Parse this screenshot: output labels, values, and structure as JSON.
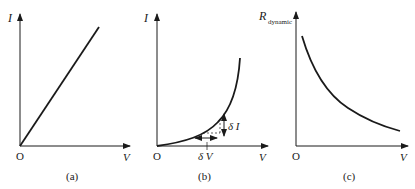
{
  "figure": {
    "panels": [
      {
        "id": "a",
        "caption": "(a)",
        "y_axis_label": "I",
        "x_axis_label": "V",
        "origin_label": "O",
        "curve": "linear"
      },
      {
        "id": "b",
        "caption": "(b)",
        "y_axis_label": "I",
        "x_axis_label": "V",
        "origin_label": "O",
        "curve": "exponential-rise",
        "annotations": {
          "delta_i": "δ I",
          "delta_v": "δ V"
        }
      },
      {
        "id": "c",
        "caption": "(c)",
        "y_axis_label_main": "R",
        "y_axis_label_sub": "dynamic",
        "x_axis_label": "V",
        "origin_label": "O",
        "curve": "decaying"
      }
    ],
    "colors": {
      "line": "#1a1a1a",
      "background": "#ffffff"
    }
  }
}
